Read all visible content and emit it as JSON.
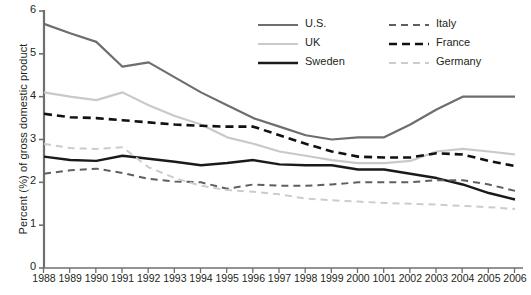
{
  "chart_data": {
    "type": "line",
    "title": "",
    "xlabel": "",
    "ylabel": "Percent (%) of gross domestic product",
    "ylim": [
      0,
      6
    ],
    "yticks": [
      0,
      1,
      2,
      3,
      4,
      5,
      6
    ],
    "grid": false,
    "legend_position": "top-right",
    "categories": [
      "1988",
      "1989",
      "1990",
      "1991",
      "1992",
      "1993",
      "1994",
      "1995",
      "1996",
      "1997",
      "1998",
      "1999",
      "2000",
      "1001",
      "2002",
      "2003",
      "2004",
      "2005",
      "2006"
    ],
    "series": [
      {
        "name": "U.S.",
        "color": "#6e6e6e",
        "style": "solid",
        "width": 2.2,
        "values": [
          5.7,
          5.48,
          5.28,
          4.7,
          4.8,
          4.45,
          4.1,
          3.8,
          3.5,
          3.3,
          3.1,
          3.0,
          3.05,
          3.05,
          3.35,
          3.7,
          4.0,
          4.0,
          4.0
        ]
      },
      {
        "name": "UK",
        "color": "#c9c9c9",
        "style": "solid",
        "width": 2.2,
        "values": [
          4.1,
          4.0,
          3.92,
          4.1,
          3.8,
          3.55,
          3.35,
          3.05,
          2.9,
          2.72,
          2.62,
          2.52,
          2.45,
          2.45,
          2.5,
          2.72,
          2.78,
          2.72,
          2.65
        ]
      },
      {
        "name": "Sweden",
        "color": "#1a1a1a",
        "style": "solid",
        "width": 2.4,
        "values": [
          2.6,
          2.52,
          2.5,
          2.62,
          2.55,
          2.48,
          2.4,
          2.45,
          2.52,
          2.42,
          2.4,
          2.4,
          2.3,
          2.3,
          2.2,
          2.1,
          1.95,
          1.75,
          1.6
        ]
      },
      {
        "name": "Italy",
        "color": "#5f5f5f",
        "style": "dashed",
        "width": 2.0,
        "values": [
          2.2,
          2.28,
          2.32,
          2.22,
          2.08,
          2.02,
          2.0,
          1.85,
          1.95,
          1.92,
          1.92,
          1.95,
          2.0,
          2.0,
          2.0,
          2.05,
          2.05,
          1.95,
          1.8
        ]
      },
      {
        "name": "France",
        "color": "#111111",
        "style": "dashed",
        "width": 2.6,
        "values": [
          3.6,
          3.52,
          3.5,
          3.45,
          3.4,
          3.35,
          3.32,
          3.3,
          3.3,
          3.1,
          2.9,
          2.72,
          2.6,
          2.58,
          2.58,
          2.68,
          2.65,
          2.5,
          2.38
        ]
      },
      {
        "name": "Germany",
        "color": "#cccccc",
        "style": "dashed",
        "width": 2.0,
        "values": [
          2.9,
          2.8,
          2.78,
          2.82,
          2.35,
          2.1,
          1.92,
          1.82,
          1.78,
          1.72,
          1.62,
          1.58,
          1.55,
          1.52,
          1.5,
          1.48,
          1.45,
          1.42,
          1.38
        ]
      }
    ],
    "axis_color": "#6f6f6f"
  }
}
